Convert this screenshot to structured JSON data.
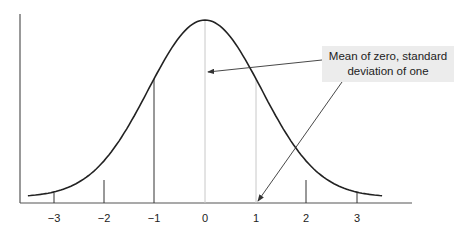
{
  "chart_data": {
    "type": "line",
    "title": "",
    "xlabel": "",
    "ylabel": "",
    "x_ticks": [
      "−3",
      "−2",
      "−1",
      "0",
      "1",
      "2",
      "3"
    ],
    "x_tick_values": [
      -3,
      -2,
      -1,
      0,
      1,
      2,
      3
    ],
    "xlim": [
      -3.5,
      3.5
    ],
    "mean": 0,
    "std_dev": 1,
    "vertical_lines": [
      {
        "x": -3,
        "style": "dark"
      },
      {
        "x": -2,
        "style": "dark"
      },
      {
        "x": -1,
        "style": "dark"
      },
      {
        "x": 0,
        "style": "light-gray"
      },
      {
        "x": 1,
        "style": "light-gray"
      },
      {
        "x": 2,
        "style": "dark"
      },
      {
        "x": 3,
        "style": "dark"
      }
    ],
    "annotation": {
      "text": "Mean of zero, standard deviation of one",
      "arrows_to": [
        {
          "x": 0,
          "y": "mid"
        },
        {
          "x": 1,
          "y": 0
        }
      ]
    },
    "grid": false,
    "legend": null
  },
  "annotation": {
    "line1": "Mean of zero, standard",
    "line2": "deviation of one"
  },
  "axis": {
    "ticks": [
      "−3",
      "−2",
      "−1",
      "0",
      "1",
      "2",
      "3"
    ]
  }
}
